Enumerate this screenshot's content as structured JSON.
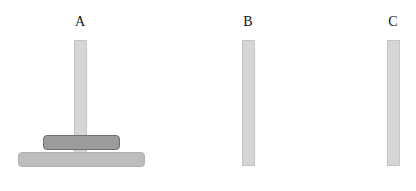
{
  "towers": [
    {
      "label": "A",
      "disks": [
        1,
        2
      ]
    },
    {
      "label": "B",
      "disks": []
    },
    {
      "label": "C",
      "disks": []
    }
  ],
  "disks": {
    "small": {
      "size": 1,
      "color": "#9c9c9c"
    },
    "large": {
      "size": 2,
      "color": "#bdbdbd"
    }
  },
  "colors": {
    "pole": "#d6d6d6",
    "background": "#ffffff"
  }
}
